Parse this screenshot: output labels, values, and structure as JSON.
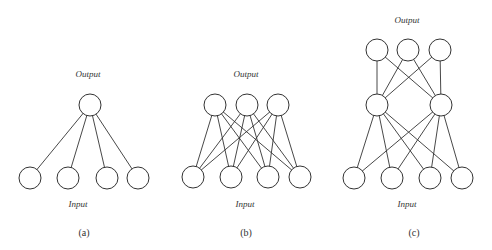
{
  "figure": {
    "panels": [
      {
        "id": "a",
        "caption": "(a)",
        "top_label": "Output",
        "bottom_label": "Input",
        "layers": [
          [
            [
              90,
              105
            ]
          ],
          [
            [
              30,
              178
            ],
            [
              68,
              178
            ],
            [
              107,
              178
            ],
            [
              138,
              178
            ]
          ]
        ],
        "connections": "full"
      },
      {
        "id": "b",
        "caption": "(b)",
        "top_label": "Output",
        "bottom_label": "Input",
        "layers": [
          [
            [
              215,
              105
            ],
            [
              247,
              105
            ],
            [
              278,
              105
            ]
          ],
          [
            [
              193,
              177
            ],
            [
              231,
              177
            ],
            [
              268,
              177
            ],
            [
              300,
              177
            ]
          ]
        ],
        "connections": "full"
      },
      {
        "id": "c",
        "caption": "(c)",
        "top_label": "Output",
        "bottom_label": "Input",
        "layers": [
          [
            [
              377,
              50
            ],
            [
              408,
              50
            ],
            [
              440,
              50
            ]
          ],
          [
            [
              377,
              105
            ],
            [
              441,
              105
            ]
          ],
          [
            [
              354,
              178
            ],
            [
              392,
              178
            ],
            [
              430,
              178
            ],
            [
              462,
              178
            ]
          ]
        ],
        "connections": "full"
      }
    ],
    "labels": {
      "a_output": "Output",
      "a_input": "Input",
      "a_caption": "(a)",
      "b_output": "Output",
      "b_input": "Input",
      "b_caption": "(b)",
      "c_output": "Output",
      "c_input": "Input",
      "c_caption": "(c)"
    },
    "node_radius": 11,
    "stroke_color": "#333333"
  }
}
